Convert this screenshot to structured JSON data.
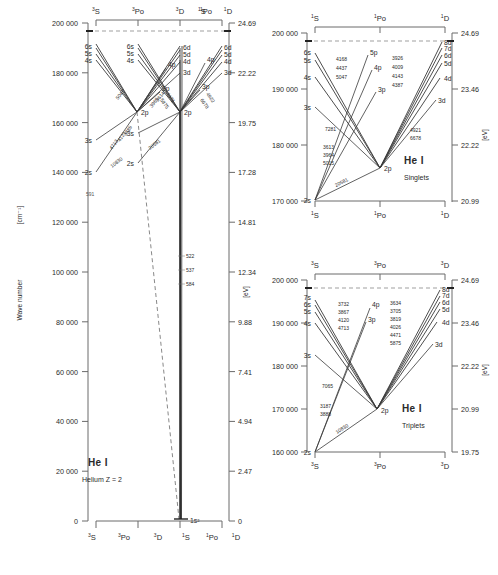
{
  "figure": {
    "domain": "diagram",
    "type": "grotrian-energy-level-diagram",
    "element": "He I"
  },
  "panels": {
    "main": {
      "title": "He I",
      "subtitle": "Helium  Z = 2",
      "y_axis_label": "Wave number",
      "y_axis_unit": "[cm⁻¹]",
      "right_axis_unit": "[eV]",
      "y_ticks": [
        "200 000",
        "180 000",
        "160 000",
        "140 000",
        "120 000",
        "100 000",
        "80 000",
        "60 000",
        "40 000",
        "20 000",
        "0"
      ],
      "y_tick_values": [
        200000,
        180000,
        160000,
        140000,
        120000,
        100000,
        80000,
        60000,
        40000,
        20000,
        0
      ],
      "ev_ticks": [
        "24.69",
        "22.22",
        "19.75",
        "17.28",
        "14.81",
        "12.34",
        "9.88",
        "7.41",
        "4.94",
        "2.47",
        "0"
      ],
      "ev_tick_values": [
        24.69,
        22.22,
        19.75,
        17.28,
        14.81,
        12.34,
        9.88,
        7.41,
        4.94,
        2.47,
        0
      ],
      "top_terms": [
        "3S",
        "3Po",
        "3D",
        "1S",
        "1Po",
        "1D"
      ],
      "bottom_terms": [
        "3S",
        "3Po",
        "3D",
        "1S",
        "1Po",
        "1D"
      ],
      "ground_state": "1s²",
      "levels_triplet_s": [
        "2s",
        "3s",
        "4s",
        "5s",
        "6s"
      ],
      "levels_triplet_p": [
        "2p",
        "3p",
        "4p"
      ],
      "levels_triplet_d": [
        "3d",
        "4d",
        "5d",
        "6d"
      ],
      "levels_singlet_s": [
        "2s",
        "3s",
        "4s",
        "5s",
        "6s"
      ],
      "levels_singlet_p": [
        "2p",
        "3p",
        "4p"
      ],
      "levels_singlet_d": [
        "3d",
        "4d",
        "5d",
        "6d"
      ],
      "resonance_lines": [
        "522",
        "537",
        "584"
      ],
      "forbidden_line": "591",
      "triplet_wl_left": [
        "4713",
        "4121",
        "3889"
      ],
      "triplet_wl_right": [
        "5875",
        "4471"
      ],
      "triplet_wl_low": [
        "10830"
      ],
      "singlet_wl_left": [
        "5047",
        "3965",
        "3614"
      ],
      "singlet_wl_right": [
        "6678",
        "4922"
      ],
      "singlet_wl_low": [
        "20581"
      ]
    },
    "singlets": {
      "title": "He I",
      "subtitle": "Singlets",
      "y_ticks": [
        "200 000",
        "190 000",
        "180 000",
        "170 000"
      ],
      "y_tick_values": [
        200000,
        190000,
        180000,
        170000
      ],
      "ev_ticks": [
        "24.69",
        "23.46",
        "22.22",
        "20.99"
      ],
      "ev_tick_values": [
        24.69,
        23.46,
        22.22,
        20.99
      ],
      "right_axis_unit": "[eV]",
      "top_terms": [
        "1S",
        "1Po",
        "1D"
      ],
      "bottom_terms": [
        "1S",
        "1Po",
        "1D"
      ],
      "levels_s": [
        "2s",
        "3s",
        "4s",
        "5s",
        "6s"
      ],
      "levels_p": [
        "2p",
        "3p",
        "4p",
        "5p"
      ],
      "levels_d": [
        "3d",
        "4d",
        "5d",
        "6d",
        "7d",
        "8d"
      ],
      "wl_s_to_p_upper": [
        "4168",
        "4437",
        "5047"
      ],
      "wl_s_to_p_lower": [
        "7281"
      ],
      "wl_p_to_s_lower": [
        "3613",
        "3964",
        "5015"
      ],
      "wl_2s_2p": [
        "20581"
      ],
      "wl_d_to_p_upper": [
        "3926",
        "4009",
        "4143",
        "4387"
      ],
      "wl_d_to_p_lower": [
        "4921",
        "6678"
      ]
    },
    "triplets": {
      "title": "He I",
      "subtitle": "Triplets",
      "y_ticks": [
        "200 000",
        "190 000",
        "180 000",
        "170 000",
        "160 000"
      ],
      "y_tick_values": [
        200000,
        190000,
        180000,
        170000,
        160000
      ],
      "ev_ticks": [
        "24.69",
        "23.46",
        "22.22",
        "20.99",
        "19.75"
      ],
      "ev_tick_values": [
        24.69,
        23.46,
        22.22,
        20.99,
        19.75
      ],
      "right_axis_unit": "[eV]",
      "top_terms": [
        "3S",
        "3Po",
        "3D"
      ],
      "bottom_terms": [
        "3S",
        "3Po",
        "3D"
      ],
      "levels_s": [
        "2s",
        "3s",
        "4s",
        "5s",
        "6s",
        "7s"
      ],
      "levels_p": [
        "2p",
        "3p",
        "4p"
      ],
      "levels_d": [
        "3d",
        "4d",
        "5d",
        "6d",
        "7d",
        "8d"
      ],
      "wl_s_to_p_upper": [
        "3732",
        "3867",
        "4120",
        "4713"
      ],
      "wl_s_to_p_lower": [
        "7065"
      ],
      "wl_p_to_s_lower": [
        "3187",
        "3888"
      ],
      "wl_2s_2p": [
        "10830"
      ],
      "wl_d_to_p_upper": [
        "3634",
        "3705",
        "3819",
        "4026",
        "4471",
        "5875"
      ]
    }
  },
  "colors": {
    "line": "#3a3a3a",
    "axis": "#6a6a6a",
    "text": "#2a2a2a",
    "faint": "#8a8a8a"
  }
}
